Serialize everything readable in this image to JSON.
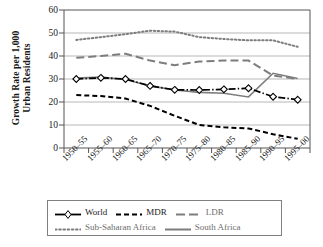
{
  "chart_data": {
    "type": "line",
    "title": "",
    "xlabel": "",
    "ylabel": "Growth Rate per 1,000 Urban Residents",
    "ylabel_lines": [
      "Growth Rate per 1,000",
      "Urban Residents"
    ],
    "categories": [
      "1950–55",
      "1955–60",
      "1960–65",
      "1965–70",
      "1970–75",
      "1975–80",
      "1980–85",
      "1985–90",
      "1990–95",
      "1995–00"
    ],
    "ylim": [
      0,
      60
    ],
    "yticks": [
      0,
      10,
      20,
      30,
      40,
      50,
      60
    ],
    "grid": "horizontal",
    "legend_position": "below-axes",
    "series": [
      {
        "name": "World",
        "style": "solid-with-diamond-markers",
        "color": "#000000",
        "marker": "diamond-open",
        "values": [
          30.0,
          30.5,
          30.0,
          27.0,
          25.3,
          25.2,
          25.5,
          26.0,
          22.3,
          21.0
        ]
      },
      {
        "name": "MDR",
        "style": "dashed",
        "color": "#000000",
        "marker": "none",
        "values": [
          23.0,
          22.6,
          21.5,
          18.3,
          14.0,
          10.0,
          9.0,
          8.5,
          6.0,
          4.0
        ]
      },
      {
        "name": "LDR",
        "style": "long-dash",
        "color": "#7d7d7d",
        "marker": "none",
        "values": [
          39.2,
          40.0,
          41.0,
          38.0,
          36.0,
          37.6,
          38.0,
          38.0,
          31.5,
          30.0
        ]
      },
      {
        "name": "Sub-Saharan Africa",
        "style": "dotted",
        "color": "#7d7d7d",
        "marker": "none",
        "values": [
          47.0,
          48.2,
          49.5,
          51.0,
          50.6,
          48.2,
          47.4,
          46.8,
          46.8,
          44.0
        ]
      },
      {
        "name": "South Africa",
        "style": "solid",
        "color": "#7d7d7d",
        "marker": "none",
        "values": [
          30.4,
          30.8,
          29.8,
          27.0,
          25.2,
          24.2,
          23.8,
          22.2,
          32.5,
          30.2
        ]
      }
    ]
  },
  "axis": {
    "ytick_labels": [
      "0",
      "10",
      "20",
      "30",
      "40",
      "50",
      "60"
    ],
    "xtick_labels": [
      "1950–55",
      "1955–60",
      "1960–65",
      "1965–70",
      "1970–75",
      "1975–80",
      "1980–85",
      "1985–90",
      "1990–95",
      "1995–00"
    ]
  },
  "legend": {
    "row1": [
      {
        "label": "World",
        "style": "solid-with-diamond-markers",
        "color": "#000000"
      },
      {
        "label": "MDR",
        "style": "dashed",
        "color": "#000000"
      },
      {
        "label": "LDR",
        "style": "long-dash",
        "color": "#7d7d7d"
      }
    ],
    "row2": [
      {
        "label": "Sub-Saharan Africa",
        "style": "dotted",
        "color": "#7d7d7d"
      },
      {
        "label": "South Africa",
        "style": "solid",
        "color": "#7d7d7d"
      }
    ]
  },
  "colors": {
    "axis": "#555555",
    "grid": "#999999",
    "black_series": "#000000",
    "gray_series": "#7d7d7d",
    "legend_border": "#808080"
  }
}
